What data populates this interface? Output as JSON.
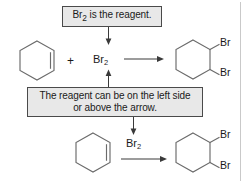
{
  "figure": {
    "kind": "reaction-scheme",
    "background_color": "#ffffff",
    "callout_fill": "#e8e8e8",
    "callout_border": "#4a4a4a",
    "molecule_stroke": "#6b6b6b",
    "arrow_color": "#3a3a3a"
  },
  "callouts": [
    {
      "id": "reagent",
      "text": "Br2 is the reagent.",
      "text_prefix": "Br",
      "text_subscript": "2",
      "text_suffix": " is the reagent."
    },
    {
      "id": "placement",
      "line1": "The reagent can be on the left side",
      "line2": "or above the arrow."
    }
  ],
  "reactions": [
    {
      "id": "top",
      "style": "reagent-on-left",
      "reactant_name": "cyclohexene",
      "plus": "+",
      "reagent_prefix": "Br",
      "reagent_subscript": "2",
      "product_name": "1,2-dibromocyclohexane",
      "product_substituents": [
        "Br",
        "Br"
      ]
    },
    {
      "id": "bottom",
      "style": "reagent-above-arrow",
      "reactant_name": "cyclohexene",
      "reagent_prefix": "Br",
      "reagent_subscript": "2",
      "product_name": "1,2-dibromocyclohexane",
      "product_substituents": [
        "Br",
        "Br"
      ]
    }
  ]
}
